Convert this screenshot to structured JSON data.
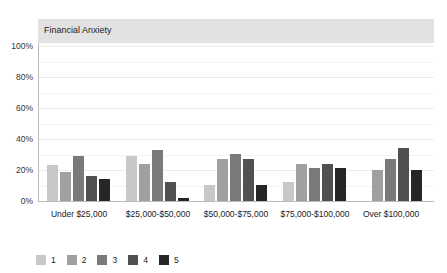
{
  "chart_data": {
    "type": "bar",
    "title": "Financial Anxiety",
    "xlabel": "",
    "ylabel": "",
    "ylim": [
      0,
      100
    ],
    "yticks": [
      "0%",
      "20%",
      "40%",
      "60%",
      "80%",
      "100%"
    ],
    "grid": true,
    "legend_position": "bottom-left",
    "categories": [
      "Under $25,000",
      "$25,000-$50,000",
      "$50,000-$75,000",
      "$75,000-$100,000",
      "Over $100,000"
    ],
    "series": [
      {
        "name": "1",
        "color": "#c8c8c8",
        "values": [
          23,
          29,
          10,
          12,
          0
        ]
      },
      {
        "name": "2",
        "color": "#a0a0a0",
        "values": [
          19,
          24,
          27,
          24,
          20
        ]
      },
      {
        "name": "3",
        "color": "#7a7a7a",
        "values": [
          29,
          33,
          30,
          21,
          27
        ]
      },
      {
        "name": "4",
        "color": "#505050",
        "values": [
          16,
          12,
          27,
          24,
          34
        ]
      },
      {
        "name": "5",
        "color": "#262626",
        "values": [
          14,
          2,
          10,
          21,
          20
        ]
      }
    ]
  }
}
